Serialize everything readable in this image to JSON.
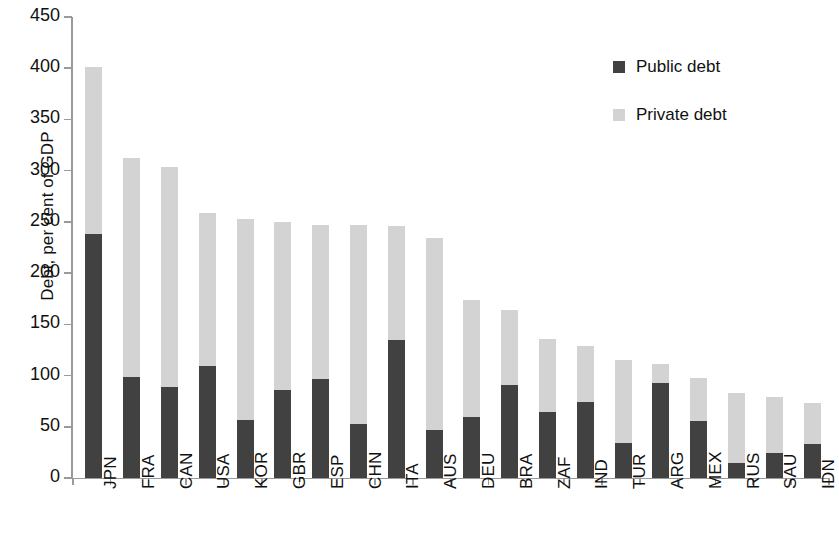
{
  "chart_data": {
    "type": "bar",
    "subtype": "stacked",
    "title": "",
    "xlabel": "",
    "ylabel": "Debt, per cent of GDP",
    "ylim": [
      0,
      450
    ],
    "ytick_step": 50,
    "yticks": [
      450,
      400,
      350,
      300,
      250,
      200,
      150,
      100,
      50,
      0
    ],
    "grid": false,
    "legend_position": "top-right",
    "categories": [
      "JPN",
      "FRA",
      "CAN",
      "USA",
      "KOR",
      "GBR",
      "ESP",
      "CHN",
      "ITA",
      "AUS",
      "DEU",
      "BRA",
      "ZAF",
      "IND",
      "TUR",
      "ARG",
      "MEX",
      "RUS",
      "SAU",
      "IDN"
    ],
    "series": [
      {
        "name": "Public debt",
        "color": "#414141",
        "values": [
          238,
          99,
          89,
          109,
          57,
          86,
          97,
          53,
          135,
          47,
          60,
          91,
          64,
          74,
          34,
          93,
          56,
          15,
          24,
          33
        ]
      },
      {
        "name": "Private debt",
        "color": "#d3d3d3",
        "values": [
          163,
          213,
          215,
          150,
          196,
          164,
          150,
          194,
          111,
          187,
          114,
          73,
          72,
          55,
          81,
          18,
          42,
          68,
          55,
          40
        ]
      }
    ],
    "totals": [
      401,
      312,
      304,
      259,
      253,
      250,
      247,
      247,
      246,
      234,
      174,
      164,
      136,
      129,
      115,
      111,
      98,
      83,
      79,
      73
    ]
  },
  "legend": {
    "items": [
      {
        "label": "Public debt",
        "color": "#414141"
      },
      {
        "label": "Private debt",
        "color": "#d3d3d3"
      }
    ]
  },
  "axes": {
    "y_title": "Debt, per cent of GDP"
  }
}
